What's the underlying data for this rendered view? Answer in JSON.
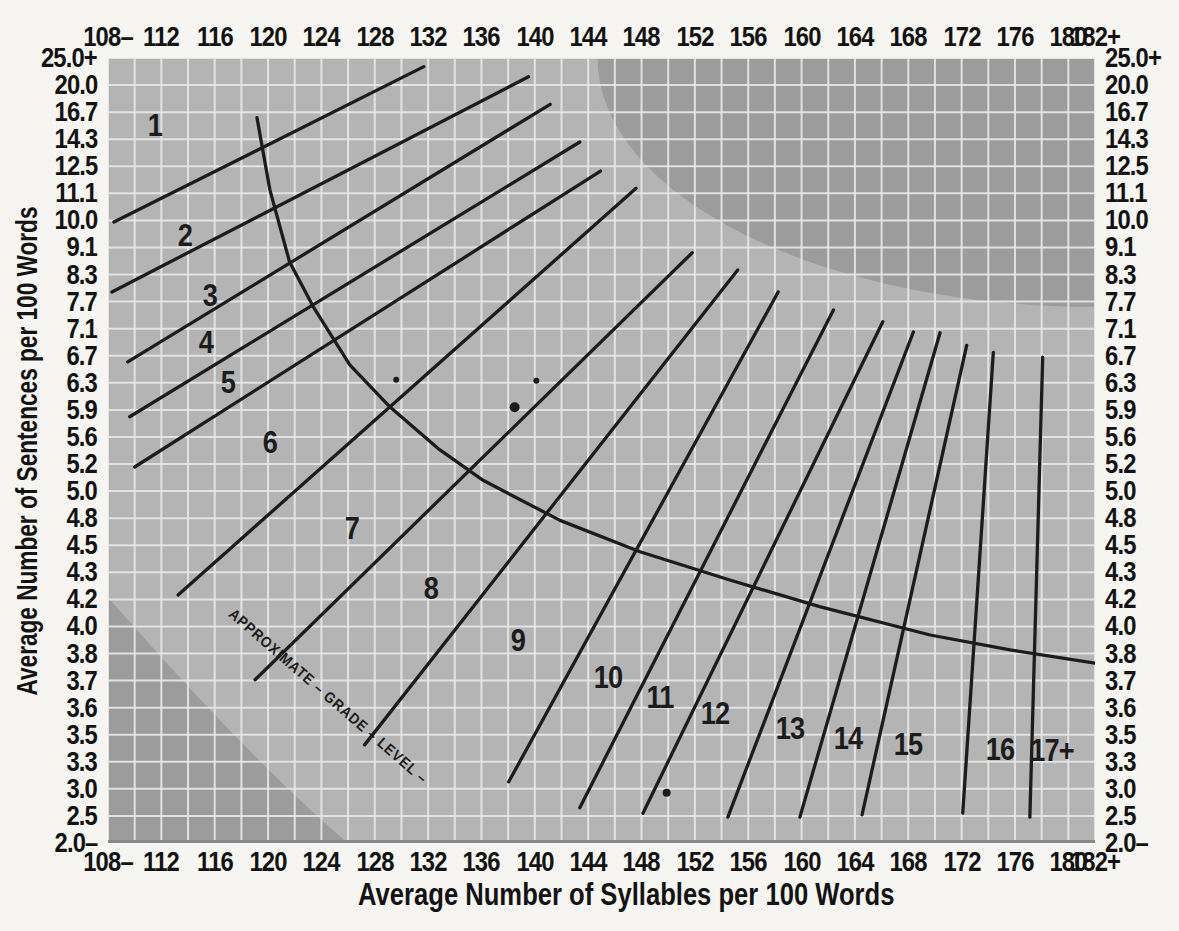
{
  "figure": {
    "x_axis_title": "Average Number of Syllables per 100 Words",
    "y_axis_title": "Average Number of Sentences per 100 Words",
    "curve_label": "APPROXIMATE GRADE LEVEL",
    "curve_label_display": "APPROXIMATE – GRADE – LEVEL –"
  },
  "chart_data": {
    "type": "line",
    "title": "",
    "xlabel": "Average Number of Syllables per 100 Words",
    "ylabel": "Average Number of Sentences per 100 Words",
    "x_range": [
      108,
      182
    ],
    "grid": true,
    "x_tick_labels": [
      "108–",
      "112",
      "116",
      "120",
      "124",
      "128",
      "132",
      "136",
      "140",
      "144",
      "148",
      "152",
      "156",
      "160",
      "164",
      "168",
      "172",
      "176",
      "180",
      "182+"
    ],
    "x_tick_pos_pct": [
      0,
      5.41,
      10.81,
      16.22,
      21.62,
      27.03,
      32.43,
      37.84,
      43.24,
      48.65,
      54.05,
      59.46,
      64.86,
      70.27,
      75.68,
      81.08,
      86.49,
      91.89,
      97.3,
      100
    ],
    "y_tick_labels": [
      "25.0+",
      "20.0",
      "16.7",
      "14.3",
      "12.5",
      "11.1",
      "10.0",
      "9.1",
      "8.3",
      "7.7",
      "7.1",
      "6.7",
      "6.3",
      "5.9",
      "5.6",
      "5.2",
      "5.0",
      "4.8",
      "4.5",
      "4.3",
      "4.2",
      "4.0",
      "3.8",
      "3.7",
      "3.6",
      "3.5",
      "3.3",
      "3.0",
      "2.5",
      "2.0–"
    ],
    "grid_v_divisions": 37,
    "grid_h_divisions": 29,
    "grade_zones": [
      {
        "label": "1",
        "x_pct": 4.8,
        "y_pct": 8.5
      },
      {
        "label": "2",
        "x_pct": 7.8,
        "y_pct": 22.5
      },
      {
        "label": "3",
        "x_pct": 10.3,
        "y_pct": 30.2
      },
      {
        "label": "4",
        "x_pct": 9.9,
        "y_pct": 36.2
      },
      {
        "label": "5",
        "x_pct": 12.2,
        "y_pct": 41.3
      },
      {
        "label": "6",
        "x_pct": 16.4,
        "y_pct": 48.9
      },
      {
        "label": "7",
        "x_pct": 24.7,
        "y_pct": 59.9
      },
      {
        "label": "8",
        "x_pct": 32.7,
        "y_pct": 67.5
      },
      {
        "label": "9",
        "x_pct": 41.5,
        "y_pct": 74.1
      },
      {
        "label": "10",
        "x_pct": 50.7,
        "y_pct": 78.9
      },
      {
        "label": "11",
        "x_pct": 55.9,
        "y_pct": 81.4
      },
      {
        "label": "12",
        "x_pct": 61.5,
        "y_pct": 83.4
      },
      {
        "label": "13",
        "x_pct": 69.1,
        "y_pct": 85.4
      },
      {
        "label": "14",
        "x_pct": 75.0,
        "y_pct": 86.6
      },
      {
        "label": "15",
        "x_pct": 81.1,
        "y_pct": 87.4
      },
      {
        "label": "16",
        "x_pct": 90.4,
        "y_pct": 88.0
      },
      {
        "label": "17+",
        "x_pct": 95.6,
        "y_pct": 88.2
      }
    ],
    "grade_lines_pct": [
      [
        0.6,
        20.9,
        32.0,
        1.1
      ],
      [
        0.4,
        29.8,
        42.6,
        2.4
      ],
      [
        2.0,
        38.7,
        44.8,
        5.9
      ],
      [
        2.2,
        45.7,
        47.8,
        10.7
      ],
      [
        2.7,
        52.1,
        49.9,
        14.4
      ],
      [
        7.1,
        68.4,
        53.5,
        16.6
      ],
      [
        14.9,
        79.2,
        59.2,
        24.8
      ],
      [
        26.0,
        87.5,
        63.8,
        27.0
      ],
      [
        40.6,
        92.2,
        67.9,
        29.8
      ],
      [
        47.8,
        95.5,
        73.5,
        32.1
      ],
      [
        54.2,
        96.2,
        78.5,
        33.6
      ],
      [
        62.8,
        96.7,
        81.6,
        34.9
      ],
      [
        70.1,
        96.7,
        84.3,
        35.0
      ],
      [
        76.4,
        96.4,
        87.0,
        36.6
      ],
      [
        86.6,
        96.2,
        89.7,
        37.5
      ],
      [
        93.4,
        96.7,
        94.7,
        38.1
      ]
    ],
    "grade_curve_pct": [
      [
        15.1,
        7.6
      ],
      [
        16.4,
        16.8
      ],
      [
        18.4,
        26.0
      ],
      [
        20.8,
        31.7
      ],
      [
        24.5,
        39.1
      ],
      [
        28.6,
        44.5
      ],
      [
        33.6,
        49.9
      ],
      [
        38.0,
        53.8
      ],
      [
        45.8,
        58.9
      ],
      [
        53.9,
        62.9
      ],
      [
        63.0,
        66.5
      ],
      [
        72.1,
        69.9
      ],
      [
        83.3,
        73.5
      ],
      [
        91.4,
        75.4
      ],
      [
        100,
        77.1
      ]
    ],
    "invalid_regions": {
      "top_right_ellipse": {
        "cx_pct": 100,
        "cy_pct": 0,
        "rx_pct": 50.4,
        "ry_pct": 31.7
      },
      "bottom_left": {
        "left_y_pct": 68.7,
        "ctrl_x_pct": 14.4,
        "ctrl_y_pct": 89.4,
        "bottom_x_pct": 24.3
      }
    },
    "data_points": [
      {
        "syllables": 129.5,
        "sentences": 6.3,
        "x_pct": 29.2,
        "y_pct": 41.0,
        "r": 3
      },
      {
        "syllables": 140.0,
        "sentences": 6.3,
        "x_pct": 43.4,
        "y_pct": 41.1,
        "r": 3
      },
      {
        "syllables": 138.5,
        "sentences": 5.9,
        "x_pct": 41.2,
        "y_pct": 44.5,
        "r": 5
      },
      {
        "syllables": 150.0,
        "sentences": 2.9,
        "x_pct": 56.6,
        "y_pct": 93.6,
        "r": 4
      }
    ],
    "colors": {
      "page_bg": "#f7f5f1",
      "plot_bg": "#b4b4b4",
      "grid": "#e9e9e9",
      "invalid_region": "#9c9c9c",
      "ink": "#1c1c1c",
      "baseline": "#898989",
      "text": "#131313"
    }
  }
}
